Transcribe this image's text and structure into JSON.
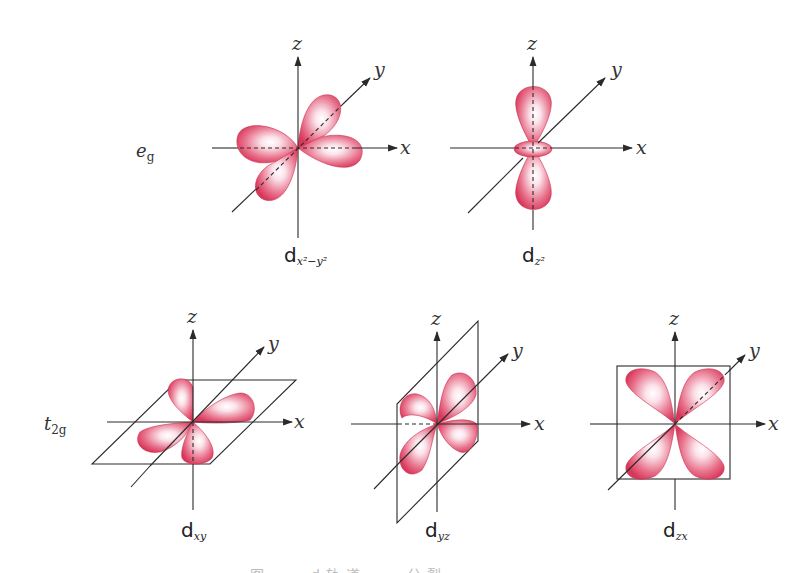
{
  "figure": {
    "groups": {
      "eg": {
        "main": "e",
        "sub": "g"
      },
      "t2g": {
        "main": "t",
        "sub": "2g"
      }
    },
    "axis_labels": {
      "x": "x",
      "y": "y",
      "z": "z"
    },
    "orbitals": [
      {
        "id": "dx2-y2",
        "label_main": "d",
        "label_sub": "x²−y²",
        "group": "eg"
      },
      {
        "id": "dz2",
        "label_main": "d",
        "label_sub": "z²",
        "group": "eg"
      },
      {
        "id": "dxy",
        "label_main": "d",
        "label_sub": "xy",
        "group": "t2g"
      },
      {
        "id": "dyz",
        "label_main": "d",
        "label_sub": "yz",
        "group": "t2g"
      },
      {
        "id": "dzx",
        "label_main": "d",
        "label_sub": "zx",
        "group": "t2g"
      }
    ],
    "colors": {
      "lobe_edge": "#d9375a",
      "lobe_highlight": "#ffffff",
      "axis": "#2a2a2a",
      "text": "#333333"
    },
    "caption_partial": "图 … d轨道 … 分裂 …"
  }
}
